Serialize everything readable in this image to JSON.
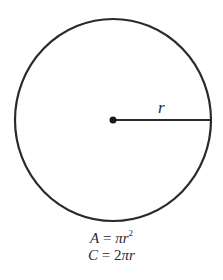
{
  "diagram": {
    "type": "circle",
    "center": {
      "x": 113,
      "y": 120
    },
    "radius": 99,
    "radius_label": "r",
    "stroke_color": "#2a2a2a"
  },
  "formulas": {
    "area": {
      "lhs": "A",
      "eq": " = ",
      "rhs_pi": "π",
      "rhs_var": "r",
      "rhs_exp": "2"
    },
    "circumference": {
      "lhs": "C",
      "eq": " = ",
      "rhs_coef": "2",
      "rhs_pi": "π",
      "rhs_var": "r"
    }
  }
}
